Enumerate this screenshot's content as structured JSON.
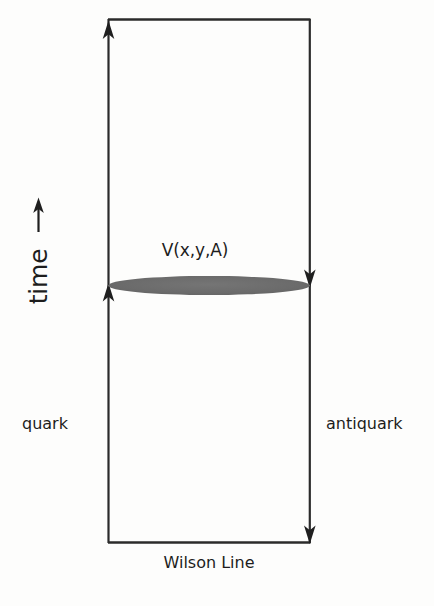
{
  "figure": {
    "background_color": "#fdfdfc",
    "line_color": "#2b2b2b",
    "blob_color": "#6a6a6a"
  },
  "labels": {
    "potential": "V(x,y,A)",
    "time": "time",
    "time_arrow": "→",
    "quark": "quark",
    "antiquark": "antiquark",
    "wilson_line": "Wilson Line"
  },
  "geometry": {
    "frame_left_x": 108,
    "frame_right_x": 310,
    "frame_top_y": 19,
    "frame_bottom_y": 543,
    "blob_center_y": 285,
    "blob_width": 202,
    "blob_height": 19,
    "stroke_width": 2.2
  },
  "arrows": [
    {
      "name": "quark-up-arrow-top",
      "x": 108,
      "y": 24,
      "direction": "up"
    },
    {
      "name": "quark-up-arrow-mid",
      "x": 108,
      "y": 295,
      "direction": "up"
    },
    {
      "name": "antiquark-down-arrow-mid",
      "x": 310,
      "y": 276,
      "direction": "down"
    },
    {
      "name": "antiquark-down-arrow-bottom",
      "x": 310,
      "y": 538,
      "direction": "down"
    },
    {
      "name": "time-axis-arrow",
      "x": 38,
      "y": 200,
      "direction": "up"
    }
  ]
}
